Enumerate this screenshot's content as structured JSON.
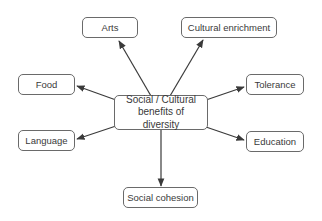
{
  "diagram": {
    "type": "spider / mind map",
    "center": {
      "line1": "Social / Cultural",
      "line2": "benefits of diversity"
    },
    "nodes": {
      "arts": "Arts",
      "cultural_enrichment": "Cultural enrichment",
      "food": "Food",
      "tolerance": "Tolerance",
      "language": "Language",
      "education": "Education",
      "social_cohesion": "Social cohesion"
    },
    "colors": {
      "arrow": "#3a3a3a",
      "border": "#6a6a6a",
      "text": "#3a3a3a",
      "background": "#ffffff"
    }
  }
}
